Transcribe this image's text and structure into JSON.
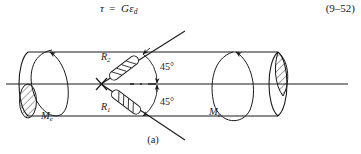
{
  "equation": {
    "lhs": "τ",
    "operator": "=",
    "rhs_main": "Gε",
    "rhs_sub": "d",
    "number": "(9–52)"
  },
  "figure": {
    "caption": "(a)",
    "torque_left_label": "M",
    "torque_left_sub": "e",
    "torque_right_label": "M",
    "torque_right_sub": "e",
    "gauge_upper_label": "R",
    "gauge_upper_sub": "2",
    "gauge_lower_label": "R",
    "gauge_lower_sub": "1",
    "angle_upper": "45°",
    "angle_lower": "45°",
    "line_color": "#1a1a1a",
    "hatch_color": "#1a1a1a",
    "background": "#ffffff"
  }
}
